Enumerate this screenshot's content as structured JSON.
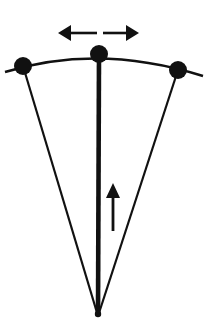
{
  "figure": {
    "title": "Pendulum swing diagram",
    "background_color": "#ffffff",
    "ink_color": "#111111",
    "width": 212,
    "height": 333
  },
  "geometry": {
    "apex": {
      "name": "pivot-apex",
      "x": 98,
      "y": 316
    },
    "arc": {
      "name": "swing-arc",
      "start_x": 5,
      "start_y": 72,
      "control_x": 99,
      "control_y": 43,
      "end_x": 203,
      "end_y": 76,
      "stroke_width": 2.4
    },
    "nodes": [
      {
        "name": "node-left",
        "label": "left extreme position",
        "cx": 23,
        "cy": 66,
        "r": 9
      },
      {
        "name": "node-center",
        "label": "center rest position",
        "cx": 99,
        "cy": 54,
        "r": 9
      },
      {
        "name": "node-right",
        "label": "right extreme position",
        "cx": 178,
        "cy": 70,
        "r": 9
      }
    ],
    "fan_lines": [
      {
        "name": "fan-line-left",
        "x1": 23,
        "y1": 66,
        "x2": 98,
        "y2": 316,
        "stroke_width": 2.2
      },
      {
        "name": "fan-line-center",
        "x1": 99,
        "y1": 54,
        "x2": 98,
        "y2": 316,
        "stroke_width": 4.6
      },
      {
        "name": "fan-line-right",
        "x1": 178,
        "y1": 70,
        "x2": 98,
        "y2": 316,
        "stroke_width": 2.2
      }
    ],
    "double_arrow": {
      "name": "oscillation-double-arrow",
      "y": 33,
      "left_tip_x": 58,
      "left_tail_x": 97,
      "right_tail_x": 103,
      "right_tip_x": 139,
      "shaft_width": 2.6,
      "head_length": 13,
      "head_half_height": 8
    },
    "up_arrow": {
      "name": "direction-up-arrow",
      "x": 113,
      "tip_y": 183,
      "tail_y": 231,
      "shaft_width": 2.8,
      "head_length": 15,
      "head_half_height": 7
    }
  },
  "annotations": {
    "double_arrow_meaning": "side-to-side swing",
    "up_arrow_meaning": "upward direction"
  }
}
